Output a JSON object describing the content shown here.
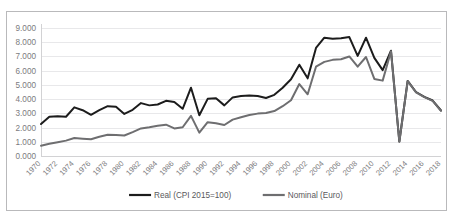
{
  "figure": {
    "cut_header_text": "",
    "frame_border_color": "#b9b9bb",
    "background_color": "#ffffff"
  },
  "chart_data": {
    "type": "line",
    "title": "",
    "subtitle": "",
    "xlabel": "",
    "ylabel": "",
    "grid": true,
    "legend_position": "bottom",
    "ylim": [
      0,
      9
    ],
    "ytick_labels": [
      "0.000",
      "1.000",
      "2.000",
      "3.000",
      "4.000",
      "5.000",
      "6.000",
      "7.000",
      "8.000",
      "9.000"
    ],
    "ytick_values": [
      0,
      1,
      2,
      3,
      4,
      5,
      6,
      7,
      8,
      9
    ],
    "xtick_labels": [
      "1970",
      "1972",
      "1974",
      "1976",
      "1978",
      "1980",
      "1982",
      "1984",
      "1986",
      "1988",
      "1990",
      "1992",
      "1994",
      "1996",
      "1998",
      "2000",
      "2002",
      "2004",
      "2006",
      "2008",
      "2010",
      "2012",
      "2014",
      "2016",
      "2018"
    ],
    "x": [
      1970,
      1971,
      1972,
      1973,
      1974,
      1975,
      1976,
      1977,
      1978,
      1979,
      1980,
      1981,
      1982,
      1983,
      1984,
      1985,
      1986,
      1987,
      1988,
      1989,
      1990,
      1991,
      1992,
      1993,
      1994,
      1995,
      1996,
      1997,
      1998,
      1999,
      2000,
      2001,
      2002,
      2003,
      2004,
      2005,
      2006,
      2007,
      2008,
      2009,
      2010,
      2011,
      2012,
      2013,
      2014,
      2015,
      2016,
      2017,
      2018
    ],
    "xlim": [
      1970,
      2018
    ],
    "series": [
      {
        "name": "Real (CPI 2015=100)",
        "color": "#1c1c1c",
        "width": 2.0,
        "values": [
          2.25,
          2.76,
          2.8,
          2.76,
          3.42,
          3.22,
          2.9,
          3.22,
          3.5,
          3.46,
          2.96,
          3.25,
          3.72,
          3.56,
          3.62,
          3.88,
          3.8,
          3.32,
          4.8,
          2.86,
          4.02,
          4.06,
          3.56,
          4.12,
          4.22,
          4.25,
          4.22,
          4.08,
          4.3,
          4.8,
          5.4,
          6.42,
          5.46,
          7.6,
          8.32,
          8.24,
          8.28,
          8.36,
          7.04,
          8.32,
          6.9,
          6.04,
          7.4,
          1.02,
          5.28,
          4.5,
          4.16,
          3.9,
          3.2
        ]
      },
      {
        "name": "Nominal (Euro)",
        "color": "#6e6e70",
        "width": 2.0,
        "values": [
          0.72,
          0.86,
          0.97,
          1.08,
          1.26,
          1.22,
          1.18,
          1.35,
          1.5,
          1.47,
          1.44,
          1.68,
          1.94,
          2.02,
          2.12,
          2.2,
          1.94,
          2.02,
          2.82,
          1.64,
          2.38,
          2.3,
          2.18,
          2.56,
          2.72,
          2.88,
          2.98,
          3.02,
          3.16,
          3.5,
          3.92,
          5.06,
          4.34,
          6.28,
          6.62,
          6.76,
          6.8,
          7.0,
          6.28,
          6.96,
          5.42,
          5.3,
          7.36,
          1.0,
          5.26,
          4.48,
          4.14,
          3.88,
          3.18
        ]
      }
    ],
    "tail_shared": {
      "note": "after 2008 both series nearly overlap",
      "x": [
        2009,
        2010,
        2011,
        2012,
        2013,
        2014,
        2015,
        2016,
        2017,
        2018
      ],
      "values": [
        1.02,
        5.28,
        4.5,
        4.16,
        3.9,
        3.2,
        5.72,
        5.02,
        1.88,
        2.02,
        4.22
      ]
    },
    "legend": [
      {
        "label": "Real (CPI 2015=100)",
        "color": "#1c1c1c"
      },
      {
        "label": "Nominal (Euro)",
        "color": "#6e6e70"
      }
    ]
  }
}
